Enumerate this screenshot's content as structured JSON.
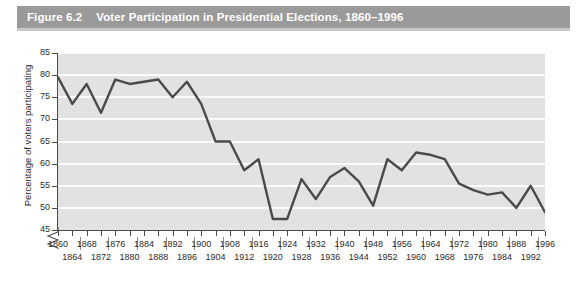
{
  "figure": {
    "number": "Figure 6.2",
    "title": "Voter Participation in Presidential Elections, 1860–1996"
  },
  "colors": {
    "title_band": "#9a9a9a",
    "title_text": "#ffffff",
    "plot_background": "#e2e2e2",
    "gridline": "#fbfbfb",
    "series_line": "#4a4a4a",
    "axis": "#4a4a4a",
    "tick_text": "#2b2b2b"
  },
  "chart_data": {
    "type": "line",
    "title": "Voter Participation in Presidential Elections, 1860–1996",
    "xlabel": "",
    "ylabel": "Percentage of voters participating",
    "xlim": [
      1860,
      1996
    ],
    "ylim": [
      45,
      85
    ],
    "yticks": [
      45,
      50,
      55,
      60,
      65,
      70,
      75,
      80,
      85
    ],
    "ytick_labels": [
      "45",
      "50",
      "55",
      "60",
      "65",
      "70",
      "75",
      "80",
      "85"
    ],
    "y_axis_break": true,
    "grid": true,
    "grid_axis": "y",
    "legend": false,
    "x": [
      1860,
      1864,
      1868,
      1872,
      1876,
      1880,
      1884,
      1888,
      1892,
      1896,
      1900,
      1904,
      1908,
      1912,
      1916,
      1920,
      1924,
      1928,
      1932,
      1936,
      1940,
      1944,
      1948,
      1952,
      1956,
      1960,
      1964,
      1968,
      1972,
      1976,
      1980,
      1984,
      1988,
      1992,
      1996
    ],
    "xtick_labels": [
      "1860",
      "1864",
      "1868",
      "1872",
      "1876",
      "1880",
      "1884",
      "1888",
      "1892",
      "1896",
      "1900",
      "1904",
      "1908",
      "1912",
      "1916",
      "1920",
      "1924",
      "1928",
      "1932",
      "1936",
      "1940",
      "1944",
      "1948",
      "1952",
      "1956",
      "1960",
      "1964",
      "1968",
      "1972",
      "1976",
      "1980",
      "1984",
      "1988",
      "1992",
      "1996"
    ],
    "values": [
      79.5,
      73.5,
      78.0,
      71.5,
      79.0,
      78.0,
      78.5,
      79.0,
      75.0,
      78.5,
      73.5,
      65.0,
      65.0,
      58.5,
      61.0,
      47.5,
      47.5,
      56.5,
      52.0,
      57.0,
      59.0,
      56.0,
      50.5,
      61.0,
      58.5,
      62.5,
      62.0,
      61.0,
      55.5,
      54.0,
      53.0,
      53.5,
      50.0,
      55.0,
      49.0
    ],
    "series": [
      {
        "name": "Percentage of voters participating",
        "values": [
          79.5,
          73.5,
          78.0,
          71.5,
          79.0,
          78.0,
          78.5,
          79.0,
          75.0,
          78.5,
          73.5,
          65.0,
          65.0,
          58.5,
          61.0,
          47.5,
          47.5,
          56.5,
          52.0,
          57.0,
          59.0,
          56.0,
          50.5,
          61.0,
          58.5,
          62.5,
          62.0,
          61.0,
          55.5,
          54.0,
          53.0,
          53.5,
          50.0,
          55.0,
          49.0
        ]
      }
    ]
  }
}
